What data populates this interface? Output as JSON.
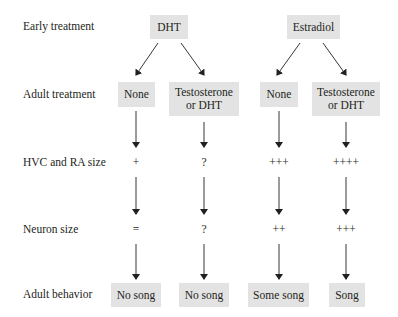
{
  "row_labels": {
    "early": "Early treatment",
    "adult": "Adult treatment",
    "hvc": "HVC and RA size",
    "neuron": "Neuron size",
    "behavior": "Adult behavior"
  },
  "early": {
    "dht": "DHT",
    "estradiol": "Estradiol"
  },
  "adult": [
    "None",
    "Testosterone or DHT",
    "None",
    "Testosterone or DHT"
  ],
  "hvc": [
    "+",
    "?",
    "+++",
    "++++"
  ],
  "neuron": [
    "=",
    "?",
    "++",
    "+++"
  ],
  "behavior": [
    "No song",
    "No song",
    "Some song",
    "Song"
  ],
  "colors": {
    "box_fill": "#e3e3e3",
    "text": "#231f20",
    "arrow": "#231f20"
  }
}
